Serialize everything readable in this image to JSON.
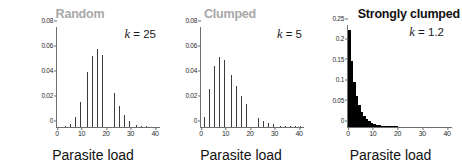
{
  "figure": {
    "caption_absent": true,
    "background": "#ffffff",
    "title_gray": "#a8a8a8",
    "title_black": "#111111",
    "bar_gray": "#3c3c3c",
    "bar_black": "#000000",
    "axis_color": "#6e6e6e"
  },
  "chart_data": [
    {
      "type": "bar",
      "title": "Random",
      "title_color": "#a8a8a8",
      "annotation": "k = 25",
      "annotation_symbol": "k",
      "annotation_value": "= 25",
      "xlabel": "Parasite load",
      "ylabel": "Frequency",
      "xlim": [
        0,
        42
      ],
      "ylim": [
        0,
        0.08
      ],
      "xticks": [
        "0",
        "10",
        "20",
        "30",
        "40"
      ],
      "xtick_values": [
        0,
        10,
        20,
        30,
        40
      ],
      "yticks": [
        "0",
        "0.02",
        "0.04",
        "0.06",
        "0.08"
      ],
      "ytick_values": [
        0,
        0.02,
        0.04,
        0.06,
        0.08
      ],
      "grid": false,
      "legend": "none",
      "bar_style": "gray-outlined",
      "x": [
        0,
        1,
        2,
        3,
        4,
        5,
        6,
        7,
        8,
        9,
        10,
        11,
        12,
        13,
        14,
        15,
        16,
        17,
        18,
        19,
        20,
        21,
        22,
        23,
        24,
        25,
        26,
        27,
        28,
        29,
        30,
        31,
        32,
        33,
        34,
        35,
        36,
        37,
        38,
        39,
        40
      ],
      "values": [
        0.0,
        0.0,
        0.0001,
        0.0003,
        0.0009,
        0.0022,
        0.0045,
        0.0082,
        0.0133,
        0.0199,
        0.0276,
        0.0359,
        0.044,
        0.0514,
        0.0572,
        0.0609,
        0.0621,
        0.061,
        0.0577,
        0.0528,
        0.0468,
        0.0403,
        0.0338,
        0.0276,
        0.022,
        0.0172,
        0.0131,
        0.0098,
        0.0072,
        0.0052,
        0.0036,
        0.0025,
        0.0017,
        0.0011,
        0.0007,
        0.0005,
        0.0003,
        0.0002,
        0.0001,
        0.0001,
        0.0
      ],
      "peak_x": 16,
      "peak_value": 0.0621
    },
    {
      "type": "bar",
      "title": "Clumped",
      "title_color": "#a8a8a8",
      "annotation": "k = 5",
      "annotation_symbol": "k",
      "annotation_value": "= 5",
      "xlabel": "Parasite load",
      "ylabel": "",
      "xlim": [
        0,
        42
      ],
      "ylim": [
        0,
        0.08
      ],
      "xticks": [
        "0",
        "10",
        "20",
        "30",
        "40"
      ],
      "xtick_values": [
        0,
        10,
        20,
        30,
        40
      ],
      "yticks": [
        "0",
        "0.02",
        "0.04",
        "0.06",
        "0.08"
      ],
      "ytick_values": [
        0,
        0.02,
        0.04,
        0.06,
        0.08
      ],
      "grid": false,
      "legend": "none",
      "bar_style": "gray-outlined",
      "x": [
        0,
        1,
        2,
        3,
        4,
        5,
        6,
        7,
        8,
        9,
        10,
        11,
        12,
        13,
        14,
        15,
        16,
        17,
        18,
        19,
        20,
        21,
        22,
        23,
        24,
        25,
        26,
        27,
        28,
        29,
        30,
        31,
        32,
        33,
        34,
        35,
        36,
        37,
        38,
        39,
        40
      ],
      "values": [
        0.0016,
        0.0078,
        0.0185,
        0.0305,
        0.0412,
        0.0492,
        0.0541,
        0.0561,
        0.0558,
        0.0537,
        0.0504,
        0.0464,
        0.042,
        0.0375,
        0.0331,
        0.0289,
        0.025,
        0.0215,
        0.0183,
        0.0155,
        0.013,
        0.0108,
        0.009,
        0.0074,
        0.0061,
        0.005,
        0.004,
        0.0033,
        0.0026,
        0.0021,
        0.0017,
        0.0013,
        0.0011,
        0.0008,
        0.0007,
        0.0005,
        0.0004,
        0.0003,
        0.0003,
        0.0002,
        0.0002
      ],
      "peak_x": 7,
      "peak_value": 0.0561
    },
    {
      "type": "bar",
      "title": "Strongly clumped",
      "title_color": "#111111",
      "annotation": "k = 1.2",
      "annotation_symbol": "k",
      "annotation_value": "= 1.2",
      "xlabel": "Parasite load",
      "ylabel": "",
      "xlim": [
        0,
        42
      ],
      "ylim": [
        0,
        0.25
      ],
      "xticks": [
        "0",
        "10",
        "20",
        "30",
        "40"
      ],
      "xtick_values": [
        0,
        10,
        20,
        30,
        40
      ],
      "yticks": [
        "0",
        "0.05",
        "0.1",
        "0.15",
        "0.2",
        "0.25"
      ],
      "ytick_values": [
        0,
        0.05,
        0.1,
        0.15,
        0.2,
        0.25
      ],
      "grid": false,
      "legend": "none",
      "bar_style": "solid-black",
      "x": [
        0,
        1,
        2,
        3,
        4,
        5,
        6,
        7,
        8,
        9,
        10,
        11,
        12,
        13,
        14,
        15,
        16,
        17,
        18,
        19,
        20,
        21,
        22,
        23,
        24,
        25,
        26,
        27,
        28,
        29,
        30,
        31,
        32,
        33,
        34,
        35,
        36,
        37,
        38,
        39,
        40
      ],
      "values": [
        0.239,
        0.162,
        0.11,
        0.076,
        0.053,
        0.0375,
        0.0268,
        0.0193,
        0.014,
        0.0102,
        0.0075,
        0.0055,
        0.0041,
        0.003,
        0.0023,
        0.0017,
        0.0013,
        0.001,
        0.0007,
        0.0006,
        0.0004,
        0.0003,
        0.0003,
        0.0002,
        0.0002,
        0.0001,
        0.0001,
        0.0001,
        0.0001,
        0.0,
        0.0,
        0.0,
        0.0,
        0.0,
        0.0,
        0.0,
        0.0,
        0.0,
        0.0,
        0.0,
        0.0
      ],
      "peak_x": 0,
      "peak_value": 0.239
    }
  ]
}
